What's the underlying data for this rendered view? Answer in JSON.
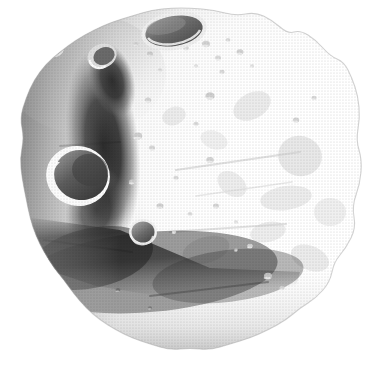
{
  "figure": {
    "kind": "astronomical-body-illustration",
    "subject": "asteroid",
    "alt_text": "Grayscale halftone illustration of an irregular, heavily cratered asteroid lit from the right",
    "caption": "",
    "title": "",
    "background_color": "#ffffff",
    "render_style": "halftone-screened grayscale airbrush illustration",
    "canvas": {
      "width": 382,
      "height": 376
    }
  },
  "palette": {
    "background": "#ffffff",
    "highlight": "#ffffff",
    "light": "#f2f2f2",
    "light_mid": "#dcdcdc",
    "mid": "#b4b4b4",
    "mid_dark": "#8a8a8a",
    "dark": "#5a5a5a",
    "shadow": "#2e2e2e",
    "deep_shadow": "#1a1a1a",
    "outline": "#9a9a9a"
  },
  "lighting": {
    "source_direction": "upper-right",
    "terminator_side": "left",
    "description": "Bright limb on the right hemisphere, deep cast shadows on the left and lower-left"
  },
  "body": {
    "silhouette_points": "190,8 214,10 236,16 255,12 272,20 288,34 300,30 316,40 330,56 344,62 352,78 358,96 360,118 356,140 362,160 360,184 352,206 356,228 346,248 334,262 330,282 316,298 300,308 286,320 268,330 250,338 230,344 210,350 190,348 170,350 150,344 132,338 116,330 100,320 86,308 74,294 64,280 54,268 44,252 36,236 30,218 26,198 22,178 20,158 24,138 20,118 26,98 34,80 46,64 60,52 76,40 94,30 112,22 132,16 152,10 172,8",
    "surface_tone_note": "Right two-thirds nearly white; left third and bottom sunk into mid and deep grays"
  },
  "features": [
    {
      "id": "crater-top-major",
      "name": "large elliptical summit crater",
      "type": "crater",
      "cx": 174,
      "cy": 31,
      "rx": 30,
      "ry": 16,
      "rotation": -10,
      "floor_tone": "#6e6e6e",
      "rim_tone": "#e8e8e8",
      "depth": "deep"
    },
    {
      "id": "crater-left-major",
      "name": "large crescent-lit crater on western limb",
      "type": "crater",
      "cx": 78,
      "cy": 176,
      "rx": 28,
      "ry": 26,
      "rotation": 12,
      "floor_tone": "#565656",
      "rim_tone": "#fbfbfb",
      "depth": "deep"
    },
    {
      "id": "crater-center-small",
      "name": "small bowl crater below center",
      "type": "crater",
      "cx": 143,
      "cy": 232,
      "rx": 12,
      "ry": 11,
      "rotation": 0,
      "floor_tone": "#6a6a6a",
      "rim_tone": "#f0f0f0",
      "depth": "moderate"
    },
    {
      "id": "crater-upper-left-rim",
      "name": "small rim crater upper left",
      "type": "crater",
      "cx": 55,
      "cy": 50,
      "rx": 7,
      "ry": 5,
      "rotation": -20,
      "floor_tone": "#5e5e5e",
      "rim_tone": "#e6e6e6",
      "depth": "shallow"
    },
    {
      "id": "ridge-central-shadow",
      "name": "central shadowed ridge",
      "type": "ridge-shadow",
      "tone": "#1f1f1f",
      "extent": "x 72-132, y 52-236"
    },
    {
      "id": "band-lower-shadow",
      "name": "lower-left diagonal shadow band",
      "type": "shadow-band",
      "tone": "#3a3a3a",
      "extent": "x 34-300, y 236-330"
    },
    {
      "id": "plain-bright-east",
      "name": "bright eastern plain",
      "type": "terrain",
      "tone": "#fdfdfd",
      "extent": "x 180-358, y 40-300"
    }
  ],
  "speckle_craters": [
    {
      "cx": 206,
      "cy": 44,
      "r": 4.0,
      "tone": "#cfcfcf"
    },
    {
      "cx": 218,
      "cy": 58,
      "r": 3.0,
      "tone": "#d6d6d6"
    },
    {
      "cx": 228,
      "cy": 40,
      "r": 2.4,
      "tone": "#d8d8d8"
    },
    {
      "cx": 240,
      "cy": 52,
      "r": 3.4,
      "tone": "#cdcdcd"
    },
    {
      "cx": 222,
      "cy": 72,
      "r": 2.6,
      "tone": "#d4d4d4"
    },
    {
      "cx": 196,
      "cy": 66,
      "r": 2.2,
      "tone": "#dcdcdc"
    },
    {
      "cx": 252,
      "cy": 66,
      "r": 2.0,
      "tone": "#dadada"
    },
    {
      "cx": 186,
      "cy": 48,
      "r": 2.8,
      "tone": "#d2d2d2"
    },
    {
      "cx": 150,
      "cy": 54,
      "r": 3.0,
      "tone": "#c8c8c8"
    },
    {
      "cx": 136,
      "cy": 44,
      "r": 2.4,
      "tone": "#cfcfcf"
    },
    {
      "cx": 160,
      "cy": 70,
      "r": 2.2,
      "tone": "#d6d6d6"
    },
    {
      "cx": 210,
      "cy": 96,
      "r": 4.6,
      "tone": "#cbcbcb"
    },
    {
      "cx": 148,
      "cy": 100,
      "r": 3.2,
      "tone": "#d0d0d0"
    },
    {
      "cx": 196,
      "cy": 124,
      "r": 2.6,
      "tone": "#d5d5d5"
    },
    {
      "cx": 138,
      "cy": 136,
      "r": 4.2,
      "tone": "#cccccc"
    },
    {
      "cx": 152,
      "cy": 148,
      "r": 3.0,
      "tone": "#d2d2d2"
    },
    {
      "cx": 210,
      "cy": 160,
      "r": 3.8,
      "tone": "#cfcfcf"
    },
    {
      "cx": 176,
      "cy": 178,
      "r": 2.6,
      "tone": "#d6d6d6"
    },
    {
      "cx": 132,
      "cy": 182,
      "r": 3.0,
      "tone": "#cfcfcf"
    },
    {
      "cx": 160,
      "cy": 206,
      "r": 3.4,
      "tone": "#cdcdcd"
    },
    {
      "cx": 190,
      "cy": 214,
      "r": 2.4,
      "tone": "#d8d8d8"
    },
    {
      "cx": 216,
      "cy": 206,
      "r": 3.0,
      "tone": "#d2d2d2"
    },
    {
      "cx": 174,
      "cy": 232,
      "r": 2.2,
      "tone": "#dadada"
    },
    {
      "cx": 268,
      "cy": 276,
      "r": 4.0,
      "tone": "#c9c9c9"
    },
    {
      "cx": 282,
      "cy": 288,
      "r": 2.6,
      "tone": "#d4d4d4"
    },
    {
      "cx": 250,
      "cy": 246,
      "r": 2.8,
      "tone": "#d6d6d6"
    },
    {
      "cx": 296,
      "cy": 120,
      "r": 3.2,
      "tone": "#d0d0d0"
    },
    {
      "cx": 314,
      "cy": 98,
      "r": 2.6,
      "tone": "#d6d6d6"
    },
    {
      "cx": 236,
      "cy": 222,
      "r": 2.0,
      "tone": "#dcdcdc"
    },
    {
      "cx": 118,
      "cy": 290,
      "r": 2.4,
      "tone": "#6e6e6e"
    },
    {
      "cx": 150,
      "cy": 308,
      "r": 2.0,
      "tone": "#7a7a7a"
    },
    {
      "cx": 236,
      "cy": 250,
      "r": 1.8,
      "tone": "#c9c9c9"
    }
  ],
  "mottles": [
    {
      "cx": 252,
      "cy": 106,
      "rx": 20,
      "ry": 13,
      "rot": -28,
      "tone": "#e2e2e2"
    },
    {
      "cx": 300,
      "cy": 156,
      "rx": 22,
      "ry": 20,
      "rot": 14,
      "tone": "#dedede"
    },
    {
      "cx": 286,
      "cy": 198,
      "rx": 26,
      "ry": 12,
      "rot": -8,
      "tone": "#e4e4e4"
    },
    {
      "cx": 232,
      "cy": 184,
      "rx": 16,
      "ry": 11,
      "rot": 36,
      "tone": "#e6e6e6"
    },
    {
      "cx": 206,
      "cy": 250,
      "rx": 24,
      "ry": 13,
      "rot": -16,
      "tone": "#dddddd"
    },
    {
      "cx": 268,
      "cy": 232,
      "rx": 18,
      "ry": 10,
      "rot": -12,
      "tone": "#e6e6e6"
    },
    {
      "cx": 330,
      "cy": 212,
      "rx": 16,
      "ry": 14,
      "rot": 0,
      "tone": "#e8e8e8"
    },
    {
      "cx": 214,
      "cy": 140,
      "rx": 14,
      "ry": 9,
      "rot": 20,
      "tone": "#e9e9e9"
    },
    {
      "cx": 174,
      "cy": 116,
      "rx": 12,
      "ry": 9,
      "rot": -20,
      "tone": "#e4e4e4"
    },
    {
      "cx": 310,
      "cy": 258,
      "rx": 20,
      "ry": 12,
      "rot": 22,
      "tone": "#e2e2e2"
    }
  ],
  "striations": [
    {
      "x1": 176,
      "y1": 170,
      "x2": 300,
      "y2": 152,
      "tone": "#cfcfcf",
      "width": 2.2
    },
    {
      "x1": 170,
      "y1": 232,
      "x2": 286,
      "y2": 224,
      "tone": "#d2d2d2",
      "width": 2.0
    },
    {
      "x1": 196,
      "y1": 196,
      "x2": 292,
      "y2": 182,
      "tone": "#dcdcdc",
      "width": 1.6
    },
    {
      "x1": 60,
      "y1": 146,
      "x2": 120,
      "y2": 142,
      "tone": "#8f8f8f",
      "width": 2.0
    },
    {
      "x1": 44,
      "y1": 240,
      "x2": 132,
      "y2": 252,
      "tone": "#6b6b6b",
      "width": 2.0
    },
    {
      "x1": 150,
      "y1": 296,
      "x2": 268,
      "y2": 282,
      "tone": "#7c7c7c",
      "width": 2.0
    }
  ]
}
